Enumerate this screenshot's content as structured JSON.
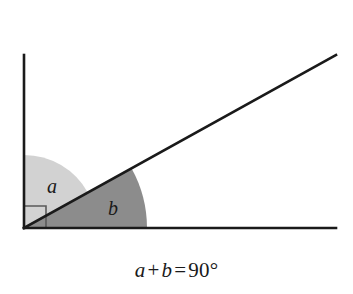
{
  "figure": {
    "caption": {
      "full": "a + b = 90°",
      "left_var": "a",
      "plus": "+",
      "right_var": "b",
      "equals": "=",
      "value": "90",
      "degree_symbol": "°"
    },
    "labels": {
      "angle_a": "a",
      "angle_b": "b"
    },
    "colors": {
      "background": "#ffffff",
      "stroke": "#1a1a1a",
      "sector_a_fill": "#d2d2d2",
      "sector_b_fill": "#8c8c8c",
      "right_angle_marker_stroke": "#5a5a5a",
      "text": "#1a1a1a"
    },
    "geometry": {
      "vertex_x": 24,
      "vertex_y": 228,
      "vertical_ray_end_x": 24,
      "vertical_ray_end_y": 55,
      "horizontal_ray_end_x": 336,
      "horizontal_ray_end_y": 228,
      "diagonal_ray_end_x": 336,
      "diagonal_ray_end_y": 55,
      "diagonal_angle_degrees": 29,
      "sector_a_radius": 73,
      "sector_b_radius": 123,
      "right_angle_marker_size": 22,
      "stroke_width": 2.6
    },
    "values": {
      "angle_a_degrees": 61,
      "angle_b_degrees": 29,
      "sum_degrees": 90
    }
  }
}
